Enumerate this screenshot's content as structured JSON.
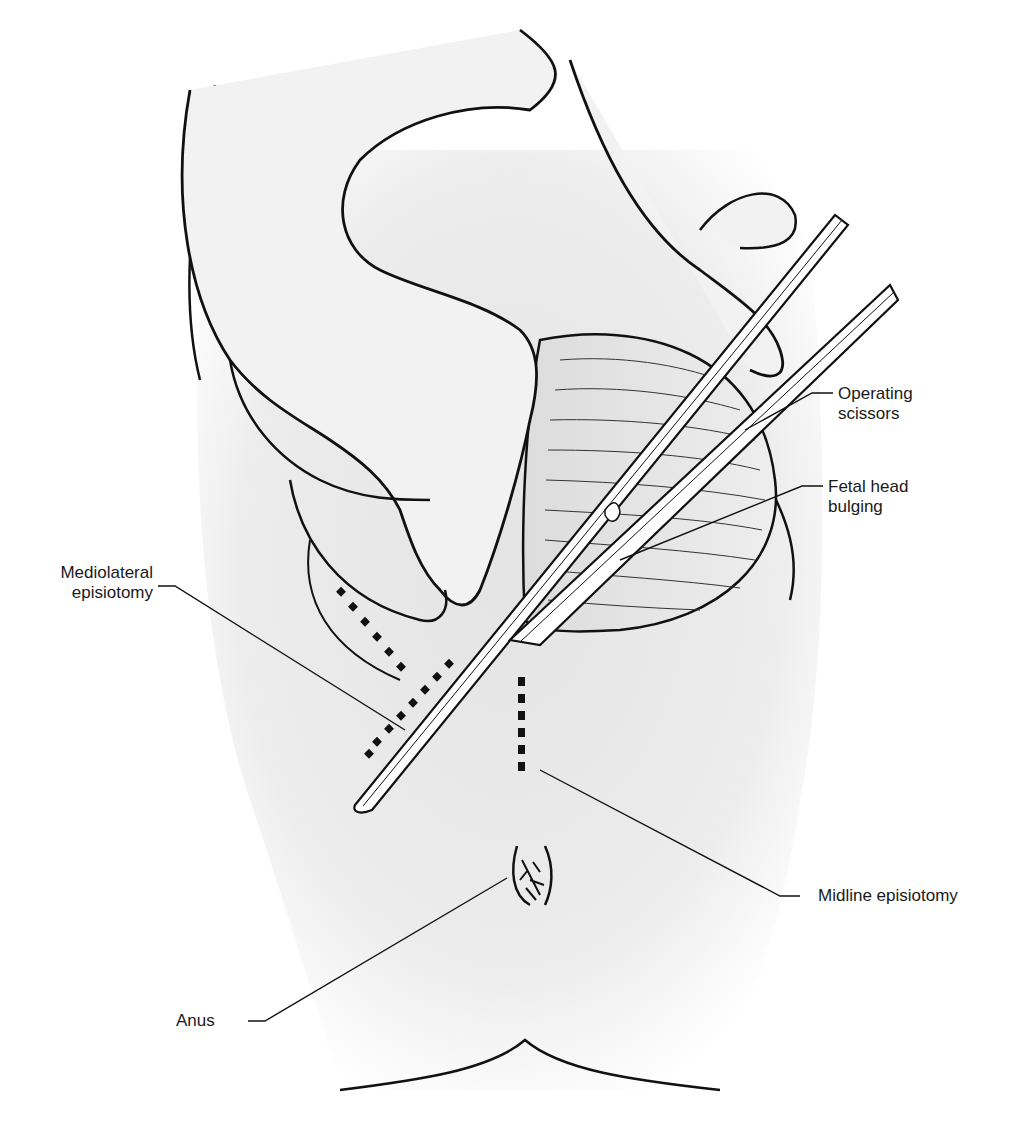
{
  "figure": {
    "colors": {
      "background": "#ffffff",
      "skin_shade": "#e9e9e9",
      "line": "#111111",
      "incision_dots": "#111111",
      "label_text": "#1a1a1a"
    },
    "labels": {
      "operating_scissors": {
        "line1": "Operating",
        "line2": "scissors"
      },
      "fetal_head": {
        "line1": "Fetal head",
        "line2": "bulging"
      },
      "mediolateral": {
        "line1": "Mediolateral",
        "line2": "episiotomy"
      },
      "midline": {
        "line1": "Midline episiotomy"
      },
      "anus": {
        "line1": "Anus"
      }
    }
  }
}
